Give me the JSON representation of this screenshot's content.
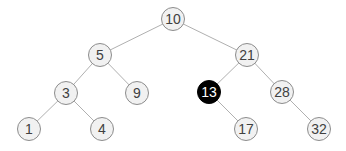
{
  "diagram": {
    "type": "binary-search-tree",
    "colors": {
      "node_fill": "#f1f1f1",
      "node_stroke": "#8c8c8c",
      "node_text": "#404040",
      "edge": "#b0b0b0",
      "highlight_fill": "#000000",
      "highlight_text": "#ffffff"
    },
    "nodes": [
      {
        "id": "n10",
        "label": "10",
        "x": 173,
        "y": 19,
        "highlight": false
      },
      {
        "id": "n5",
        "label": "5",
        "x": 100,
        "y": 55,
        "highlight": false
      },
      {
        "id": "n21",
        "label": "21",
        "x": 247,
        "y": 55,
        "highlight": false
      },
      {
        "id": "n3",
        "label": "3",
        "x": 66,
        "y": 93,
        "highlight": false
      },
      {
        "id": "n9",
        "label": "9",
        "x": 137,
        "y": 93,
        "highlight": false
      },
      {
        "id": "n13",
        "label": "13",
        "x": 209,
        "y": 92,
        "highlight": true
      },
      {
        "id": "n28",
        "label": "28",
        "x": 282,
        "y": 92,
        "highlight": false
      },
      {
        "id": "n1",
        "label": "1",
        "x": 29,
        "y": 129,
        "highlight": false
      },
      {
        "id": "n4",
        "label": "4",
        "x": 102,
        "y": 129,
        "highlight": false
      },
      {
        "id": "n17",
        "label": "17",
        "x": 246,
        "y": 129,
        "highlight": false
      },
      {
        "id": "n32",
        "label": "32",
        "x": 319,
        "y": 129,
        "highlight": false
      }
    ],
    "edges": [
      {
        "from": "n10",
        "to": "n5"
      },
      {
        "from": "n10",
        "to": "n21"
      },
      {
        "from": "n5",
        "to": "n3"
      },
      {
        "from": "n5",
        "to": "n9"
      },
      {
        "from": "n3",
        "to": "n1"
      },
      {
        "from": "n3",
        "to": "n4"
      },
      {
        "from": "n21",
        "to": "n13"
      },
      {
        "from": "n21",
        "to": "n28"
      },
      {
        "from": "n13",
        "to": "n17"
      },
      {
        "from": "n28",
        "to": "n32"
      }
    ]
  }
}
